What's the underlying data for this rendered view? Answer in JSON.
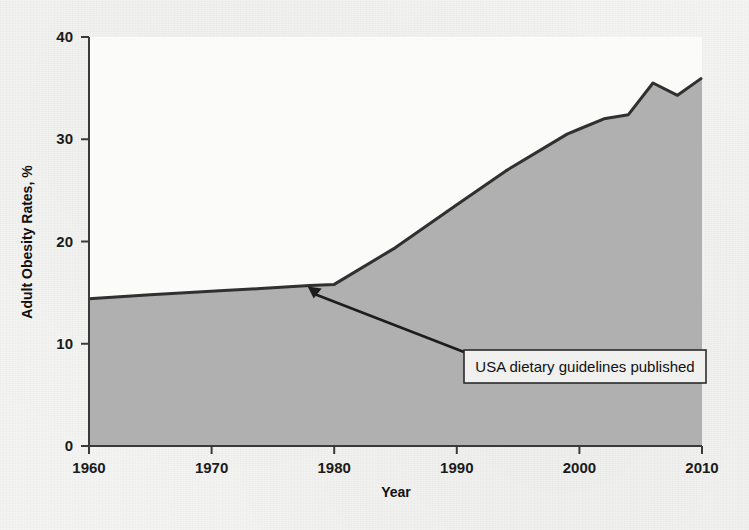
{
  "chart_data": {
    "type": "area",
    "title": "",
    "xlabel": "Year",
    "ylabel": "Adult Obesity Rates, %",
    "xlim": [
      1960,
      2010
    ],
    "ylim": [
      0,
      40
    ],
    "xticks": [
      "1960",
      "1970",
      "1980",
      "1990",
      "2000",
      "2010"
    ],
    "yticks": [
      "0",
      "10",
      "20",
      "30",
      "40"
    ],
    "grid": false,
    "legend": "none",
    "series": [
      {
        "name": "Adult obesity rate",
        "x": [
          1960,
          1965,
          1971,
          1974,
          1978,
          1980,
          1985,
          1990,
          1994,
          1999,
          2000,
          2002,
          2004,
          2006,
          2008,
          2010
        ],
        "values": [
          14.4,
          14.8,
          15.2,
          15.4,
          15.7,
          15.8,
          19.4,
          23.6,
          26.9,
          30.5,
          31.0,
          32.0,
          32.4,
          35.5,
          34.3,
          36.0
        ]
      }
    ],
    "annotations": [
      {
        "text": "USA dietary guidelines published",
        "points_to_year": 1978,
        "points_to_value": 15.7
      }
    ],
    "colors": {
      "area_fill": "#b0b0b0",
      "line": "#303030",
      "axis": "#3a3a3a",
      "plot_background": "#fbfbfa",
      "page_background": "#f4f4f2",
      "annotation_box_fill": "#f0f0ee",
      "annotation_box_border": "#2b2b2b",
      "text": "#141414"
    }
  }
}
